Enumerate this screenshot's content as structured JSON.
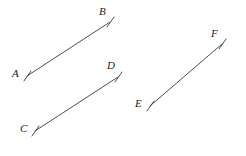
{
  "figure": {
    "type": "geometry-diagram",
    "width": 246,
    "height": 156,
    "background_color": "#ffffff",
    "stroke_color": "#3a3a3a",
    "label_color": "#1c1c1c",
    "segments": [
      {
        "id": "AB",
        "name": "segment-ab",
        "start": {
          "label": "A",
          "x": 27,
          "y": 76
        },
        "end": {
          "label": "B",
          "x": 110,
          "y": 22
        },
        "tick_start": {
          "x1": 24,
          "y1": 81,
          "x2": 31,
          "y2": 71
        },
        "tick_end": {
          "x1": 107,
          "y1": 27,
          "x2": 114,
          "y2": 17
        }
      },
      {
        "id": "CD",
        "name": "segment-cd",
        "start": {
          "label": "C",
          "x": 35,
          "y": 131
        },
        "end": {
          "label": "D",
          "x": 118,
          "y": 77
        },
        "tick_start": {
          "x1": 32,
          "y1": 136,
          "x2": 39,
          "y2": 126
        },
        "tick_end": {
          "x1": 115,
          "y1": 82,
          "x2": 122,
          "y2": 72
        }
      },
      {
        "id": "EF",
        "name": "segment-ef",
        "start": {
          "label": "E",
          "x": 150,
          "y": 106
        },
        "end": {
          "label": "F",
          "x": 222,
          "y": 44
        },
        "tick_start": {
          "x1": 147,
          "y1": 111,
          "x2": 154,
          "y2": 101
        },
        "tick_end": {
          "x1": 219,
          "y1": 49,
          "x2": 226,
          "y2": 39
        }
      }
    ],
    "labels": [
      {
        "text": "A",
        "name": "point-label-a",
        "x": 12,
        "y": 68
      },
      {
        "text": "B",
        "name": "point-label-b",
        "x": 99,
        "y": 6
      },
      {
        "text": "C",
        "name": "point-label-c",
        "x": 20,
        "y": 123
      },
      {
        "text": "D",
        "name": "point-label-d",
        "x": 107,
        "y": 60
      },
      {
        "text": "E",
        "name": "point-label-e",
        "x": 135,
        "y": 98
      },
      {
        "text": "F",
        "name": "point-label-f",
        "x": 211,
        "y": 28
      }
    ]
  }
}
